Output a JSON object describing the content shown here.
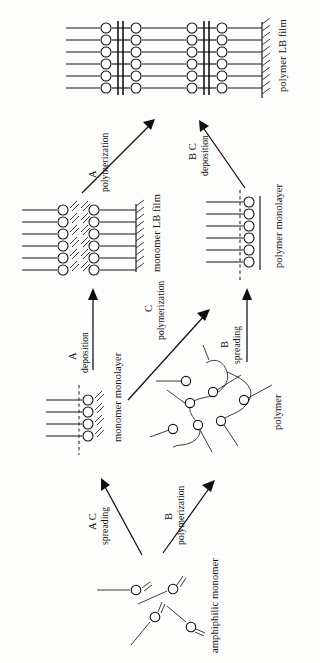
{
  "figure": {
    "orientation": "rotated-90-ccw",
    "background_color": "#fdfdfc",
    "ink_color": "#121212"
  },
  "nodes": {
    "amphiphilic_monomer": {
      "label": "amphiphilic monomer",
      "kind": "scattered-molecules",
      "molecule_count": 4
    },
    "monomer_monolayer": {
      "label": "monomer monolayer",
      "kind": "monolayer",
      "chain_count": 4,
      "has_water_surface_dashed_line": true,
      "has_double_bonds": true
    },
    "polymer": {
      "label": "polymer",
      "kind": "random-coil",
      "head_group_count": 7
    },
    "polymer_monolayer": {
      "label": "polymer monolayer",
      "kind": "monolayer",
      "chain_count": 6,
      "has_water_surface_dashed_line": true,
      "has_backbone_line": true
    },
    "monomer_lb_film": {
      "label": "monomer LB film",
      "kind": "multilayer-film",
      "row_count": 6,
      "bilayer_count": 1,
      "has_double_bonds": true,
      "has_substrate": true
    },
    "polymer_lb_film": {
      "label": "polymer LB film",
      "kind": "multilayer-film",
      "row_count": 6,
      "bilayer_count": 2,
      "has_backbone_lines": true,
      "has_substrate": true
    }
  },
  "arrows": [
    {
      "id": "arrow-ac-spreading",
      "route": "A C",
      "process": "spreading",
      "from": "amphiphilic_monomer",
      "to": "monomer_monolayer",
      "style": "diagonal"
    },
    {
      "id": "arrow-b-polymerization",
      "route": "B",
      "process": "polymerization",
      "from": "amphiphilic_monomer",
      "to": "polymer",
      "style": "diagonal"
    },
    {
      "id": "arrow-a-deposition",
      "route": "A",
      "process": "deposition",
      "from": "monomer_monolayer",
      "to": "monomer_lb_film",
      "style": "straight"
    },
    {
      "id": "arrow-c-polymerization",
      "route": "C",
      "process": "polymerization",
      "from": "monomer_monolayer",
      "to": "polymer_monolayer",
      "style": "diagonal"
    },
    {
      "id": "arrow-b-spreading",
      "route": "B",
      "process": "spreading",
      "from": "polymer",
      "to": "polymer_monolayer",
      "style": "straight"
    },
    {
      "id": "arrow-a-polymerization",
      "route": "A",
      "process": "polymerization",
      "from": "monomer_lb_film",
      "to": "polymer_lb_film",
      "style": "diagonal"
    },
    {
      "id": "arrow-bc-deposition",
      "route": "B C",
      "process": "deposition",
      "from": "polymer_monolayer",
      "to": "polymer_lb_film",
      "style": "diagonal"
    }
  ]
}
